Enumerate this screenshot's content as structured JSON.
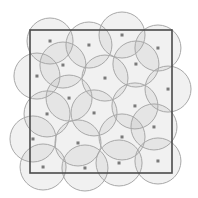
{
  "diagram": {
    "type": "disk-covering",
    "domain": {
      "xmin": 0,
      "xmax": 1,
      "ymin": 0,
      "ymax": 1
    },
    "radius": 0.162,
    "colors": {
      "disc_fill": "#aaaaaa",
      "disc_stroke": "#a8a8a8",
      "center": "#7a7a7a",
      "frame": "#4a4a4a",
      "background": "#ffffff"
    },
    "centers": [
      [
        0.141,
        0.077
      ],
      [
        0.415,
        0.105
      ],
      [
        0.648,
        0.035
      ],
      [
        0.901,
        0.126
      ],
      [
        0.232,
        0.245
      ],
      [
        0.746,
        0.238
      ],
      [
        0.049,
        0.322
      ],
      [
        0.528,
        0.336
      ],
      [
        0.972,
        0.413
      ],
      [
        0.275,
        0.476
      ],
      [
        0.739,
        0.531
      ],
      [
        0.12,
        0.587
      ],
      [
        0.451,
        0.58
      ],
      [
        0.873,
        0.678
      ],
      [
        0.021,
        0.762
      ],
      [
        0.338,
        0.79
      ],
      [
        0.648,
        0.748
      ],
      [
        0.092,
        0.958
      ],
      [
        0.387,
        0.965
      ],
      [
        0.627,
        0.93
      ],
      [
        0.901,
        0.916
      ]
    ]
  }
}
